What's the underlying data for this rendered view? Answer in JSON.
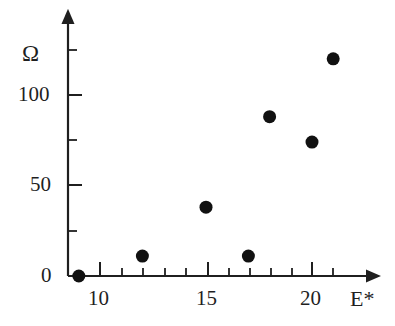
{
  "figure": {
    "background_color": "#ffffff",
    "ink_color": "#1f1f1f",
    "marker_color": "#111111"
  },
  "axes": {
    "y_axis": {
      "title": "Ω",
      "tick_labels": [
        "100",
        "50",
        "0"
      ],
      "tick_values": [
        100,
        50,
        0
      ],
      "minor_tick_values": [
        125,
        75,
        25
      ],
      "arrow": "up"
    },
    "x_axis": {
      "title": "E*",
      "tick_labels": [
        "10",
        "15",
        "20"
      ],
      "tick_values": [
        10,
        15,
        20
      ],
      "minor_tick_values": [
        11,
        12,
        13,
        14,
        16,
        17,
        18,
        19,
        21
      ],
      "arrow": "right"
    }
  },
  "chart_data": {
    "type": "scatter",
    "title": "",
    "xlabel": "E*",
    "ylabel": "Ω",
    "xlim": [
      8.0,
      22.5
    ],
    "ylim": [
      0,
      140
    ],
    "grid": false,
    "legend": null,
    "x": [
      9,
      12,
      15,
      17,
      18,
      20,
      21
    ],
    "y": [
      0,
      11,
      38,
      11,
      88,
      74,
      120
    ],
    "points": [
      {
        "x": 9,
        "y": 0
      },
      {
        "x": 12,
        "y": 11
      },
      {
        "x": 15,
        "y": 38
      },
      {
        "x": 17,
        "y": 11
      },
      {
        "x": 18,
        "y": 88
      },
      {
        "x": 20,
        "y": 74
      },
      {
        "x": 21,
        "y": 120
      }
    ],
    "marker": {
      "shape": "circle",
      "size_px": 13,
      "color": "#111111"
    }
  }
}
